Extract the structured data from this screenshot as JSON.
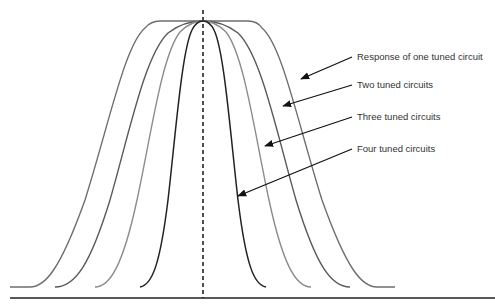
{
  "diagram": {
    "labels": [
      {
        "id": "one",
        "text": "Response of one tuned circuit",
        "x": 357,
        "y": 52
      },
      {
        "id": "two",
        "text": "Two tuned circuits",
        "x": 357,
        "y": 80
      },
      {
        "id": "three",
        "text": "Three tuned circuits",
        "x": 357,
        "y": 112
      },
      {
        "id": "four",
        "text": "Four tuned circuits",
        "x": 357,
        "y": 144
      }
    ],
    "colors": {
      "one": "#6e6e6e",
      "two": "#5a5a5a",
      "three": "#8c8c8c",
      "four": "#222222",
      "axis": "#222222",
      "arrow": "#111111"
    }
  }
}
